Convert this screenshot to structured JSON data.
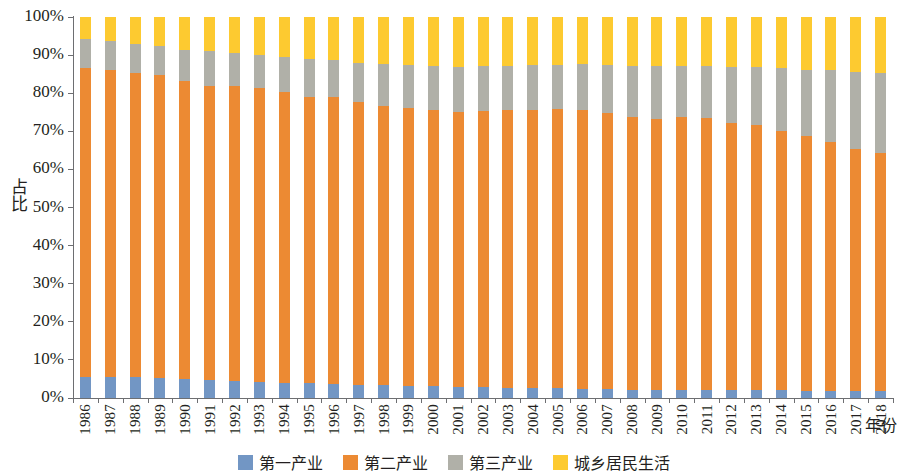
{
  "chart_data": {
    "type": "bar",
    "subtype": "stacked-percentage",
    "title": "",
    "xlabel": "年份",
    "ylabel": "占比",
    "ylim": [
      0,
      100
    ],
    "yticks": [
      "0%",
      "10%",
      "20%",
      "30%",
      "40%",
      "50%",
      "60%",
      "70%",
      "80%",
      "90%",
      "100%"
    ],
    "ytick_values": [
      0,
      10,
      20,
      30,
      40,
      50,
      60,
      70,
      80,
      90,
      100
    ],
    "grid": false,
    "legend_position": "bottom",
    "categories": [
      "1986",
      "1987",
      "1988",
      "1989",
      "1990",
      "1991",
      "1992",
      "1993",
      "1994",
      "1995",
      "1996",
      "1997",
      "1998",
      "1999",
      "2000",
      "2001",
      "2002",
      "2003",
      "2004",
      "2005",
      "2006",
      "2007",
      "2008",
      "2009",
      "2010",
      "2011",
      "2012",
      "2013",
      "2014",
      "2015",
      "2016",
      "2017",
      "2018"
    ],
    "series": [
      {
        "name": "第一产业",
        "color": "#7296c4",
        "values": [
          5.5,
          5.6,
          5.4,
          5.2,
          4.9,
          4.6,
          4.4,
          4.3,
          4.0,
          3.9,
          3.8,
          3.5,
          3.3,
          3.2,
          3.1,
          2.9,
          2.8,
          2.7,
          2.6,
          2.5,
          2.4,
          2.3,
          2.2,
          2.2,
          2.1,
          2.1,
          2.0,
          2.0,
          2.0,
          1.9,
          1.9,
          1.8,
          1.8
        ]
      },
      {
        "name": "第二产业",
        "color": "#ec8a33",
        "values": [
          81.2,
          80.6,
          79.8,
          79.5,
          78.2,
          77.4,
          77.6,
          77.0,
          76.3,
          75.1,
          75.3,
          74.2,
          73.3,
          73.0,
          72.6,
          72.3,
          72.5,
          73.0,
          73.1,
          73.3,
          73.2,
          72.4,
          71.5,
          71.1,
          71.6,
          71.3,
          70.2,
          69.7,
          68.1,
          66.8,
          65.3,
          63.6,
          62.4
        ]
      },
      {
        "name": "第三产业",
        "color": "#b0b0a8",
        "values": [
          7.6,
          7.6,
          7.7,
          7.7,
          8.3,
          9.1,
          8.5,
          8.8,
          9.2,
          9.9,
          9.5,
          10.3,
          11.0,
          11.3,
          11.5,
          11.8,
          11.8,
          11.5,
          11.6,
          11.6,
          12.0,
          12.7,
          13.4,
          13.8,
          13.5,
          13.7,
          14.6,
          15.2,
          16.5,
          17.5,
          18.8,
          20.2,
          21.2
        ]
      },
      {
        "name": "城乡居民生活",
        "color": "#fdca30",
        "values": [
          5.7,
          6.2,
          7.1,
          7.6,
          8.6,
          8.9,
          9.5,
          9.9,
          10.5,
          11.1,
          11.4,
          12.0,
          12.4,
          12.5,
          12.8,
          13.0,
          12.9,
          12.8,
          12.7,
          12.6,
          12.4,
          12.6,
          12.9,
          12.9,
          12.8,
          12.9,
          13.2,
          13.1,
          13.4,
          13.8,
          14.0,
          14.4,
          14.6
        ]
      }
    ]
  }
}
